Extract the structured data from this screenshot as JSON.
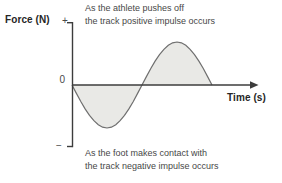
{
  "figure": {
    "y_axis_label": "Force (N)",
    "x_axis_label": "Time (s)",
    "y_tick_plus": "+",
    "y_tick_zero": "0",
    "y_tick_minus": "−",
    "annotation_positive": {
      "line1": "As the athlete pushes off",
      "line2": "the track positive impulse occurs"
    },
    "annotation_negative": {
      "line1": "As the foot makes contact with",
      "line2": "the track negative impulse occurs"
    }
  },
  "colors": {
    "background": "#ffffff",
    "axis": "#3c3c3c",
    "curve": "#6f6f6f",
    "fill": "#e9e9e6",
    "label_text": "#262626",
    "annotation_text": "#474747"
  },
  "chart_data": {
    "type": "area",
    "title": "",
    "xlabel": "Time (s)",
    "ylabel": "Force (N)",
    "x_ticks": [],
    "y_ticks": [
      "+",
      "0",
      "−"
    ],
    "grid": false,
    "legend": false,
    "series": [
      {
        "name": "Force",
        "x": [
          0,
          0.0625,
          0.125,
          0.1875,
          0.25,
          0.3125,
          0.375,
          0.4375,
          0.5,
          0.5625,
          0.625,
          0.6875,
          0.75,
          0.8125,
          0.875,
          0.9375,
          1,
          1.0625,
          1.125,
          1.1875,
          1.25,
          1.3125,
          1.375,
          1.4375,
          1.5,
          1.5625,
          1.625,
          1.6875,
          1.75,
          1.8125,
          1.875,
          1.9375,
          2
        ],
        "y": [
          0,
          -0.195,
          -0.383,
          -0.556,
          -0.707,
          -0.831,
          -0.924,
          -0.981,
          -1,
          -0.981,
          -0.924,
          -0.831,
          -0.707,
          -0.556,
          -0.383,
          -0.195,
          0,
          0.195,
          0.383,
          0.556,
          0.707,
          0.831,
          0.924,
          0.981,
          1,
          0.981,
          0.924,
          0.831,
          0.707,
          0.556,
          0.383,
          0.195,
          0
        ]
      }
    ],
    "annotations": [
      "As the athlete pushes off the track positive impulse occurs",
      "As the foot makes contact with the track negative impulse occurs"
    ]
  }
}
